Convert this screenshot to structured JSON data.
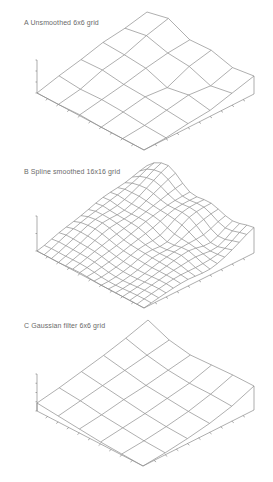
{
  "chart_data": [
    {
      "type": "surface",
      "title": "A  Unsmoothed 6x6 grid",
      "grid": [
        6,
        6
      ],
      "geometry": {
        "left": [
          37,
          93
        ],
        "front": [
          144,
          150
        ],
        "right": [
          254,
          94
        ],
        "z_axis_top": 60
      },
      "z_ticks_count": 3,
      "heights": [
        [
          0,
          6,
          11,
          17,
          20,
          25
        ],
        [
          0,
          4,
          12,
          16,
          24,
          30
        ],
        [
          1,
          5,
          9,
          14,
          18,
          20
        ],
        [
          0,
          4,
          8,
          6,
          16,
          21
        ],
        [
          0,
          2,
          6,
          10,
          8,
          15
        ],
        [
          0,
          1,
          4,
          6,
          12,
          18
        ]
      ],
      "xlabel": "",
      "ylabel": "",
      "zlabel": ""
    },
    {
      "type": "surface",
      "title": "B  Spline smoothed 16x16 grid",
      "grid": [
        16,
        16
      ],
      "geometry": {
        "left": [
          37,
          251
        ],
        "front": [
          144,
          308
        ],
        "right": [
          254,
          253
        ],
        "z_axis_top": 216
      },
      "z_ticks_count": 2,
      "heights_from": "smoothed_A",
      "xlabel": "",
      "ylabel": "",
      "zlabel": ""
    },
    {
      "type": "surface",
      "title": "C  Gaussian filter 6x6 grid",
      "grid": [
        6,
        6
      ],
      "geometry": {
        "left": [
          37,
          411
        ],
        "front": [
          143,
          466
        ],
        "right": [
          254,
          410
        ],
        "z_axis_top": 374
      },
      "z_ticks_count": 4,
      "heights": [
        [
          8,
          12,
          17,
          22,
          28,
          35
        ],
        [
          6,
          10,
          14,
          18,
          22,
          26
        ],
        [
          4,
          7,
          11,
          14,
          18,
          22
        ],
        [
          2,
          5,
          8,
          12,
          16,
          23
        ],
        [
          1,
          3,
          6,
          10,
          16,
          24
        ],
        [
          0,
          2,
          5,
          9,
          15,
          24
        ]
      ],
      "xlabel": "",
      "ylabel": "",
      "zlabel": ""
    }
  ],
  "panels": {
    "a_title": "A  Unsmoothed 6x6 grid",
    "b_title": "B  Spline smoothed 16x16 grid",
    "c_title": "C  Gaussian filter 6x6 grid"
  }
}
